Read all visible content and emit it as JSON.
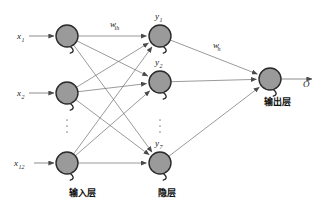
{
  "diagram": {
    "colors": {
      "node_fill": "#9a9a9a",
      "node_stroke": "#2b2b2b",
      "edge": "#6e6e6e",
      "text": "#1a1a1a",
      "background": "#ffffff"
    },
    "layers": [
      {
        "id": "input",
        "caption": "输入层",
        "caption_x": 82,
        "caption_y": 196,
        "nodes": [
          {
            "label": "x",
            "sub": "1",
            "cx": 67,
            "cy": 36,
            "r": 11
          },
          {
            "label": "x",
            "sub": "2",
            "cx": 67,
            "cy": 93,
            "r": 11
          },
          {
            "label": "x",
            "sub": "12",
            "cx": 67,
            "cy": 163,
            "r": 11
          }
        ],
        "ellipsis": {
          "x": 67,
          "y": 126,
          "dots": 3
        }
      },
      {
        "id": "hidden",
        "caption": "隐层",
        "caption_x": 167,
        "caption_y": 196,
        "nodes": [
          {
            "label": "y",
            "sub": "1",
            "cx": 160,
            "cy": 36,
            "r": 11
          },
          {
            "label": "y",
            "sub": "2",
            "cx": 160,
            "cy": 82,
            "r": 11
          },
          {
            "label": "y",
            "sub": "7",
            "cx": 160,
            "cy": 163,
            "r": 11
          }
        ],
        "ellipsis": {
          "x": 160,
          "y": 126,
          "dots": 3
        }
      },
      {
        "id": "output",
        "caption": "输出层",
        "caption_x": 277,
        "caption_y": 105,
        "nodes": [
          {
            "label": "O",
            "sub": "",
            "cx": 270,
            "cy": 79,
            "r": 11
          }
        ],
        "ellipsis": null
      }
    ],
    "weights": [
      {
        "id": "w-input-hidden",
        "label": "w",
        "sub": "ih",
        "x": 110,
        "y": 27
      },
      {
        "id": "w-hidden-output",
        "label": "w",
        "sub": "h",
        "x": 213,
        "y": 48
      }
    ],
    "output_signal": {
      "label": "O",
      "x": 303,
      "y": 87
    },
    "input_arrows": [
      {
        "from_x": 29,
        "to_x": 54,
        "y": 36
      },
      {
        "from_x": 29,
        "to_x": 54,
        "y": 93
      },
      {
        "from_x": 34,
        "to_x": 54,
        "y": 163
      }
    ],
    "input_value_labels": [
      {
        "label": "x",
        "sub": "1",
        "x": 17,
        "y": 39
      },
      {
        "label": "x",
        "sub": "2",
        "x": 17,
        "y": 96
      },
      {
        "label": "x",
        "sub": "12",
        "x": 14,
        "y": 166
      }
    ],
    "hidden_value_labels": [
      {
        "label": "y",
        "sub": "1",
        "x": 155,
        "y": 19
      },
      {
        "label": "y",
        "sub": "2",
        "x": 155,
        "y": 65
      },
      {
        "label": "y",
        "sub": "7",
        "x": 155,
        "y": 146
      }
    ],
    "connections": {
      "input_to_hidden": [
        {
          "from": 0,
          "to": 0
        },
        {
          "from": 0,
          "to": 1
        },
        {
          "from": 0,
          "to": 2
        },
        {
          "from": 1,
          "to": 0
        },
        {
          "from": 1,
          "to": 1
        },
        {
          "from": 1,
          "to": 2
        },
        {
          "from": 2,
          "to": 0
        },
        {
          "from": 2,
          "to": 1
        },
        {
          "from": 2,
          "to": 2
        }
      ],
      "hidden_to_output": [
        {
          "from": 0,
          "to": 0
        },
        {
          "from": 1,
          "to": 0
        },
        {
          "from": 2,
          "to": 0
        }
      ]
    }
  }
}
